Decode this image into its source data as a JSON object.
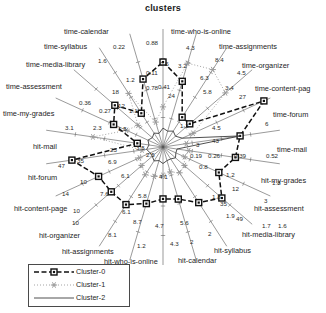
{
  "chart_data": {
    "type": "radar",
    "title": "clusters",
    "xlabel": "",
    "ylabel": "",
    "grid": false,
    "legend_position": "bottom-left",
    "center": {
      "x": 163,
      "y": 147
    },
    "max_radius": 118,
    "categories": [
      "time-who-is-online",
      "time-assignments",
      "time-organizer",
      "time-content-page",
      "time-forum",
      "time-mail",
      "hit-my-grades",
      "hit-assessment",
      "hit-media-library",
      "hit-syllabus",
      "hit-calendar",
      "hit-who-is-online",
      "hit-assignments",
      "hit-organizer",
      "hit-content-page",
      "hit-forum",
      "hit-mail",
      "time-my-grades",
      "time-assessment",
      "time-media-library",
      "time-syllabus",
      "time-calendar"
    ],
    "series": [
      {
        "name": "Cluster-0",
        "marker": "square",
        "line": "dashed",
        "color": "#101010",
        "values": [
          0.72,
          0.58,
          0.3,
          0.3,
          0.94,
          0.66,
          0.62,
          0.52,
          0.66,
          0.56,
          0.46,
          0.44,
          0.5,
          0.58,
          0.58,
          0.6,
          0.78,
          0.22,
          0.46,
          0.54,
          0.34,
          0.6
        ]
      },
      {
        "name": "Cluster-1",
        "marker": "star",
        "line": "dotted",
        "color": "#9a9a9a",
        "values": [
          0.34,
          0.74,
          0.78,
          0.7,
          0.28,
          0.2,
          0.22,
          0.2,
          0.24,
          0.26,
          0.22,
          0.24,
          0.26,
          0.28,
          0.24,
          0.22,
          0.18,
          0.6,
          0.34,
          0.28,
          0.54,
          0.22
        ]
      },
      {
        "name": "Cluster-2",
        "marker": "none",
        "line": "solid",
        "color": "#3c3c3c",
        "values": [
          0.16,
          0.14,
          0.16,
          0.14,
          0.18,
          0.66,
          0.12,
          0.12,
          0.14,
          0.12,
          0.12,
          0.14,
          0.12,
          0.14,
          0.12,
          0.12,
          0.14,
          0.12,
          0.14,
          0.12,
          0.14,
          0.12
        ]
      }
    ],
    "tick_labels": [
      {
        "text": "0.22",
        "x": 113,
        "y": 43
      },
      {
        "text": "0.88",
        "x": 146,
        "y": 39
      },
      {
        "text": "4.3",
        "x": 186,
        "y": 44
      },
      {
        "text": "8.4",
        "x": 215,
        "y": 56
      },
      {
        "text": "1.6",
        "x": 98,
        "y": 57
      },
      {
        "text": "0.5",
        "x": 160,
        "y": 60
      },
      {
        "text": "3.2",
        "x": 178,
        "y": 62
      },
      {
        "text": "4.5",
        "x": 237,
        "y": 69
      },
      {
        "text": "0.11",
        "x": 146,
        "y": 69
      },
      {
        "text": "1.2",
        "x": 126,
        "y": 76
      },
      {
        "text": "6.3",
        "x": 200,
        "y": 74
      },
      {
        "text": "3.4",
        "x": 225,
        "y": 84
      },
      {
        "text": "18",
        "x": 112,
        "y": 88
      },
      {
        "text": "0.78",
        "x": 146,
        "y": 84
      },
      {
        "text": "0.41",
        "x": 158,
        "y": 83
      },
      {
        "text": "5.8",
        "x": 203,
        "y": 88
      },
      {
        "text": "27",
        "x": 239,
        "y": 93
      },
      {
        "text": "0.36",
        "x": 79,
        "y": 99
      },
      {
        "text": "12",
        "x": 118,
        "y": 102
      },
      {
        "text": "0.27",
        "x": 99,
        "y": 107
      },
      {
        "text": "1.1",
        "x": 129,
        "y": 107
      },
      {
        "text": "24",
        "x": 168,
        "y": 92
      },
      {
        "text": "6",
        "x": 265,
        "y": 120
      },
      {
        "text": "3.1",
        "x": 65,
        "y": 124
      },
      {
        "text": "2.3",
        "x": 93,
        "y": 124
      },
      {
        "text": "1.5",
        "x": 118,
        "y": 125
      },
      {
        "text": "1.3",
        "x": 180,
        "y": 122
      },
      {
        "text": "4.5",
        "x": 212,
        "y": 124
      },
      {
        "text": "43",
        "x": 212,
        "y": 137
      },
      {
        "text": "3",
        "x": 196,
        "y": 141
      },
      {
        "text": "0.52",
        "x": 266,
        "y": 152
      },
      {
        "text": "0.39",
        "x": 234,
        "y": 152
      },
      {
        "text": "0.26",
        "x": 208,
        "y": 152
      },
      {
        "text": "0.19",
        "x": 190,
        "y": 152
      },
      {
        "text": "23",
        "x": 110,
        "y": 146
      },
      {
        "text": "3.5",
        "x": 136,
        "y": 144
      },
      {
        "text": "2.5",
        "x": 146,
        "y": 151
      },
      {
        "text": "35",
        "x": 77,
        "y": 157
      },
      {
        "text": "47",
        "x": 58,
        "y": 162
      },
      {
        "text": "6.9",
        "x": 108,
        "y": 158
      },
      {
        "text": "0.8",
        "x": 199,
        "y": 163
      },
      {
        "text": "1.2",
        "x": 226,
        "y": 171
      },
      {
        "text": "10",
        "x": 80,
        "y": 178
      },
      {
        "text": "6.1",
        "x": 121,
        "y": 172
      },
      {
        "text": "4.1",
        "x": 159,
        "y": 173
      },
      {
        "text": "1.8",
        "x": 272,
        "y": 179
      },
      {
        "text": "14",
        "x": 62,
        "y": 190
      },
      {
        "text": "7.6",
        "x": 100,
        "y": 190
      },
      {
        "text": "5.8",
        "x": 138,
        "y": 192
      },
      {
        "text": "1.8",
        "x": 212,
        "y": 193
      },
      {
        "text": "12",
        "x": 232,
        "y": 185
      },
      {
        "text": "35",
        "x": 220,
        "y": 200
      },
      {
        "text": "3",
        "x": 264,
        "y": 197
      },
      {
        "text": "10",
        "x": 73,
        "y": 207
      },
      {
        "text": "6.1",
        "x": 122,
        "y": 208
      },
      {
        "text": "1.9",
        "x": 226,
        "y": 212
      },
      {
        "text": "49",
        "x": 236,
        "y": 215
      },
      {
        "text": "10",
        "x": 72,
        "y": 219
      },
      {
        "text": "8.7",
        "x": 133,
        "y": 218
      },
      {
        "text": "4.7",
        "x": 155,
        "y": 222
      },
      {
        "text": "5.6",
        "x": 180,
        "y": 219
      },
      {
        "text": "1.7",
        "x": 262,
        "y": 222
      },
      {
        "text": "1.6",
        "x": 278,
        "y": 222
      },
      {
        "text": "8.1",
        "x": 108,
        "y": 231
      },
      {
        "text": "2",
        "x": 208,
        "y": 230
      },
      {
        "text": "1.2",
        "x": 137,
        "y": 242
      },
      {
        "text": "4.3",
        "x": 170,
        "y": 240
      },
      {
        "text": "2",
        "x": 190,
        "y": 238
      }
    ],
    "axis_labels": [
      {
        "text": "time-calendar",
        "x": 64,
        "y": 28,
        "anchor": "start"
      },
      {
        "text": "time-who-is-online",
        "x": 171,
        "y": 28,
        "anchor": "start"
      },
      {
        "text": "time-syllabus",
        "x": 44,
        "y": 43,
        "anchor": "start"
      },
      {
        "text": "time-assignments",
        "x": 219,
        "y": 43,
        "anchor": "start"
      },
      {
        "text": "time-media-library",
        "x": 26,
        "y": 61,
        "anchor": "start"
      },
      {
        "text": "time-organizer",
        "x": 242,
        "y": 62,
        "anchor": "start"
      },
      {
        "text": "time-assessment",
        "x": 6,
        "y": 83,
        "anchor": "start"
      },
      {
        "text": "time-content-pag",
        "x": 255,
        "y": 85,
        "anchor": "start"
      },
      {
        "text": "time-my-grades",
        "x": 3,
        "y": 110,
        "anchor": "start"
      },
      {
        "text": "time-forum",
        "x": 273,
        "y": 111,
        "anchor": "start"
      },
      {
        "text": "hit-mail",
        "x": 33,
        "y": 143,
        "anchor": "start"
      },
      {
        "text": "time-mail",
        "x": 277,
        "y": 146,
        "anchor": "start"
      },
      {
        "text": "hit-forum",
        "x": 28,
        "y": 174,
        "anchor": "start"
      },
      {
        "text": "hit-my-grades",
        "x": 261,
        "y": 177,
        "anchor": "start"
      },
      {
        "text": "hit-content-page",
        "x": 14,
        "y": 205,
        "anchor": "start"
      },
      {
        "text": "hit-assessment",
        "x": 254,
        "y": 205,
        "anchor": "start"
      },
      {
        "text": "hit-organizer",
        "x": 39,
        "y": 232,
        "anchor": "start"
      },
      {
        "text": "hit-media-library",
        "x": 242,
        "y": 231,
        "anchor": "start"
      },
      {
        "text": "hit-assignments",
        "x": 62,
        "y": 248,
        "anchor": "start"
      },
      {
        "text": "hit-syllabus",
        "x": 214,
        "y": 247,
        "anchor": "start"
      },
      {
        "text": "hit-who-is-online",
        "x": 104,
        "y": 258,
        "anchor": "start"
      },
      {
        "text": "hit-calendar",
        "x": 178,
        "y": 257,
        "anchor": "start"
      }
    ]
  },
  "legend": {
    "entries": [
      {
        "label": "Cluster-0"
      },
      {
        "label": "Cluster-1"
      },
      {
        "label": "Cluster-2"
      }
    ]
  }
}
